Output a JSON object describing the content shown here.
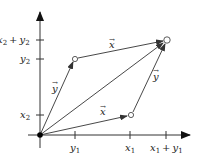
{
  "diagram": {
    "colors": {
      "line": "#333333",
      "background": "#ffffff"
    },
    "axes": {
      "x_ticks": [
        {
          "label": "x",
          "sub": "1",
          "plus": "",
          "label2": "",
          "sub2": ""
        },
        {
          "label": "y",
          "sub": "1"
        },
        {
          "label": "x",
          "sub": "1",
          "plus": "+",
          "label2": "y",
          "sub2": "1"
        }
      ],
      "y_ticks": [
        {
          "label": "x",
          "sub": "2"
        },
        {
          "label": "y",
          "sub": "2"
        },
        {
          "label": "x",
          "sub": "2",
          "plus": "+",
          "label2": "y",
          "sub2": "2"
        }
      ]
    },
    "vectors": {
      "x_label": "x⃗",
      "y_label": "y⃗",
      "x_char": "x",
      "y_char": "y",
      "arrow": "→"
    },
    "points": {
      "origin": "filled",
      "x_point": "open",
      "y_point": "open",
      "sum_point": "open"
    }
  }
}
